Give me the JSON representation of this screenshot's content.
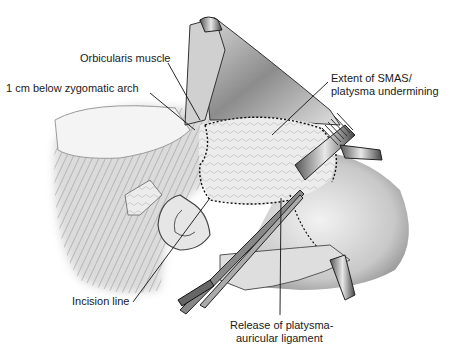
{
  "figure": {
    "labels": [
      {
        "id": "orbicularis",
        "text": "Orbicularis muscle",
        "x": 80,
        "y": 58
      },
      {
        "id": "zygomatic",
        "text": "1 cm below zygomatic arch",
        "x": 6,
        "y": 88
      },
      {
        "id": "smas_line1",
        "text": "Extent of SMAS/",
        "x": 330,
        "y": 78
      },
      {
        "id": "smas_line2",
        "text": "platysma undermining",
        "x": 330,
        "y": 91
      },
      {
        "id": "incision",
        "text": "Incision line",
        "x": 72,
        "y": 300
      },
      {
        "id": "release_line1",
        "text": "Release of platysma-",
        "x": 230,
        "y": 320
      },
      {
        "id": "release_line2",
        "text": "auricular ligament",
        "x": 236,
        "y": 333
      }
    ],
    "colors": {
      "ink": "#1a1a1a",
      "skin_light": "#e8e8e8",
      "skin_mid": "#bdbdbd",
      "shadow": "#6e6e6e",
      "background": "#ffffff"
    }
  }
}
